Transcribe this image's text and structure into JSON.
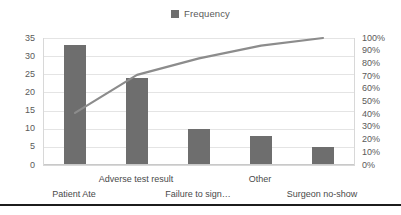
{
  "legend": {
    "position": "top-center",
    "entries": [
      {
        "label": "Frequency",
        "color": "#6e6e6e",
        "marker": "square"
      }
    ]
  },
  "colors": {
    "bar": "#6e6e6e",
    "line": "#8c8c8c",
    "gridline": "#e4e4e4",
    "axis_text": "#5a5a5a",
    "category_text": "#4a4a4a",
    "plot_border": "#d8d8d8",
    "bottom_rule": "#1c1c1c",
    "background": "#ffffff"
  },
  "chart_data": {
    "type": "bar",
    "subtype": "pareto",
    "title": "",
    "subtitle": "",
    "xlabel": "",
    "ylabel": "",
    "y2label": "",
    "grid": true,
    "legend_position": "top",
    "categories": [
      "Patient Ate",
      "Adverse test result",
      "Failure to sign…",
      "Other",
      "Surgeon no-show"
    ],
    "series": [
      {
        "name": "Frequency",
        "type": "bar",
        "axis": "left",
        "color": "#6e6e6e",
        "values": [
          33,
          24,
          10,
          8,
          5
        ]
      },
      {
        "name": "Cumulative %",
        "type": "line",
        "axis": "right",
        "color": "#8c8c8c",
        "values": [
          41,
          71,
          84,
          94,
          100
        ]
      }
    ],
    "ylim": [
      0,
      35
    ],
    "yticks": [
      0,
      5,
      10,
      15,
      20,
      25,
      30,
      35
    ],
    "ytick_labels": [
      "0",
      "5",
      "10",
      "15",
      "20",
      "25",
      "30",
      "35"
    ],
    "y2lim": [
      0,
      100
    ],
    "y2ticks": [
      0,
      10,
      20,
      30,
      40,
      50,
      60,
      70,
      80,
      90,
      100
    ],
    "y2tick_labels": [
      "0%",
      "10%",
      "20%",
      "30%",
      "40%",
      "50%",
      "60%",
      "70%",
      "80%",
      "90%",
      "100%"
    ],
    "total": 80
  }
}
